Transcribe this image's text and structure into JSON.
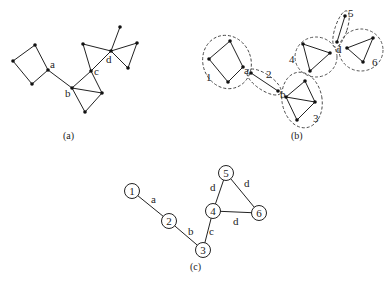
{
  "figure_a": {
    "caption": "(a)",
    "labels": {
      "a": "a",
      "b": "b",
      "c": "c",
      "d": "d"
    }
  },
  "figure_b": {
    "caption": "(b)",
    "vertex_labels": {
      "a": "a",
      "b": "b",
      "d": "d"
    },
    "block_labels": [
      "1",
      "2",
      "3",
      "4",
      "5",
      "6"
    ]
  },
  "figure_c": {
    "caption": "(c)",
    "nodes": [
      "1",
      "2",
      "3",
      "4",
      "5",
      "6"
    ],
    "edge_labels": {
      "e12": "a",
      "e23": "b",
      "e34": "c",
      "e45": "d",
      "e56": "d",
      "e46": "d"
    }
  }
}
